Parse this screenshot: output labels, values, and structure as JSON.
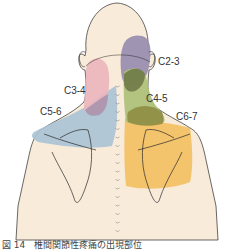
{
  "figure": {
    "labels": {
      "c2_3": "C2-3",
      "c3_4": "C3-4",
      "c4_5": "C4-5",
      "c5_6": "C5-6",
      "c6_7": "C6-7"
    },
    "caption": "図 14　椎間関節性疼痛の出現部位"
  },
  "colors": {
    "skin": "#f8ebda",
    "outline": "#2a2a2a",
    "c2_3": "#9a8fb0",
    "c3_4": "#ebb5bd",
    "c4_5": "#aec27a",
    "c4_5_overlap": "#6f7a48",
    "c5_6": "#a8c3d4",
    "c6_7": "#f3c064"
  }
}
